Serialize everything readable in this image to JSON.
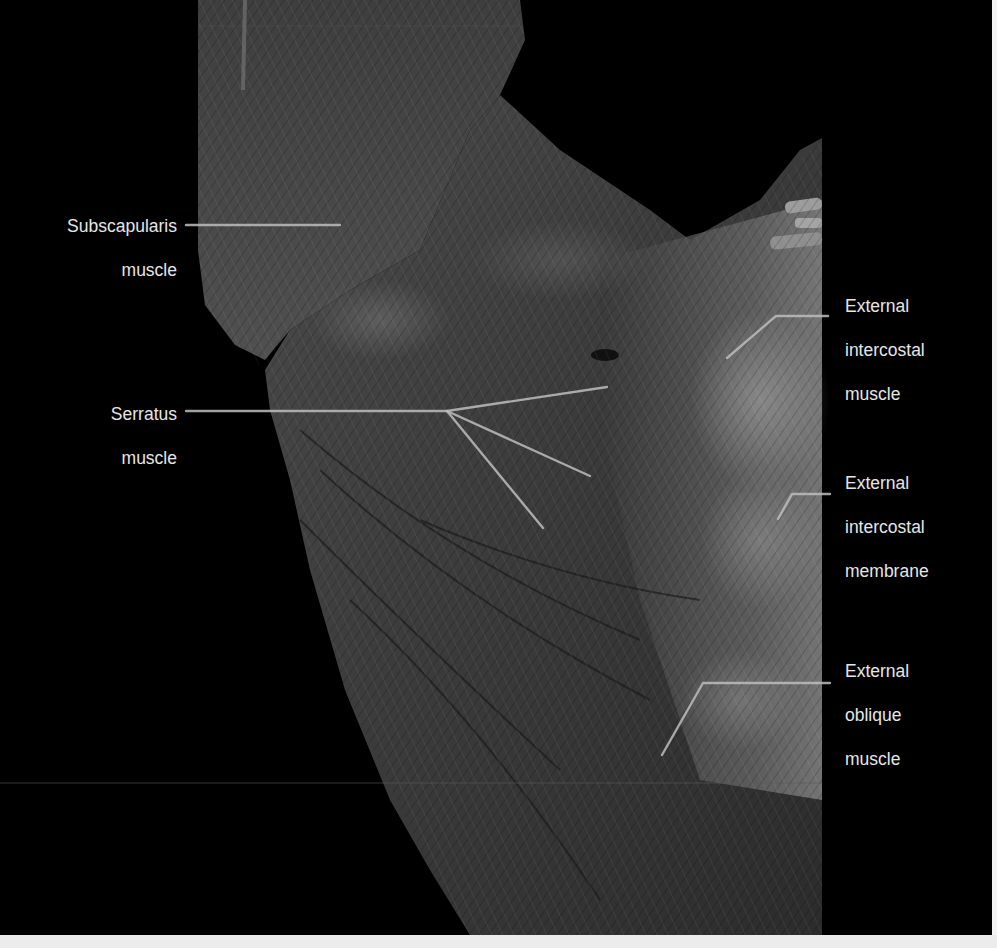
{
  "figure": {
    "background": "#000000",
    "labels": [
      {
        "id": "subscapularis",
        "lines": [
          "Subscapularis",
          "muscle"
        ],
        "align": "right",
        "x": 40,
        "y": 193,
        "width": 137
      },
      {
        "id": "serratus",
        "lines": [
          "Serratus",
          "muscle"
        ],
        "align": "right",
        "x": 60,
        "y": 381,
        "width": 117
      },
      {
        "id": "external-intercostal-muscle",
        "lines": [
          "External",
          "intercostal",
          "muscle"
        ],
        "align": "left",
        "x": 845,
        "y": 273,
        "width": 140
      },
      {
        "id": "external-intercostal-membrane",
        "lines": [
          "External",
          "intercostal",
          "membrane"
        ],
        "align": "left",
        "x": 845,
        "y": 450,
        "width": 140
      },
      {
        "id": "external-oblique",
        "lines": [
          "External",
          "oblique",
          "muscle"
        ],
        "align": "left",
        "x": 845,
        "y": 638,
        "width": 140
      }
    ],
    "leaders": [
      {
        "for": "subscapularis",
        "points": [
          [
            186,
            225
          ],
          [
            340,
            225
          ]
        ]
      },
      {
        "for": "serratus",
        "points": [
          [
            186,
            411
          ],
          [
            447,
            411
          ],
          [
            607,
            387
          ]
        ]
      },
      {
        "for": "serratus-branch-2",
        "points": [
          [
            447,
            411
          ],
          [
            590,
            476
          ]
        ]
      },
      {
        "for": "serratus-branch-3",
        "points": [
          [
            447,
            411
          ],
          [
            543,
            528
          ]
        ]
      },
      {
        "for": "external-intercostal-muscle",
        "points": [
          [
            828,
            316
          ],
          [
            776,
            316
          ],
          [
            727,
            358
          ]
        ]
      },
      {
        "for": "external-intercostal-membrane",
        "points": [
          [
            830,
            494
          ],
          [
            792,
            494
          ],
          [
            778,
            519
          ]
        ]
      },
      {
        "for": "external-oblique",
        "points": [
          [
            830,
            683
          ],
          [
            703,
            683
          ],
          [
            662,
            755
          ]
        ]
      }
    ],
    "leader_color": "#bdbdbd",
    "label_color": "#e6e6e6"
  }
}
